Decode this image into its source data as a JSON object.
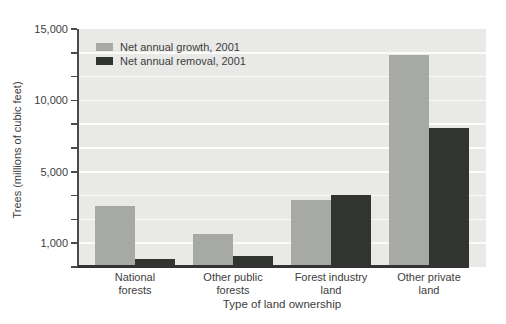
{
  "chart_data": {
    "type": "bar",
    "title": "",
    "xlabel": "Type of land ownership",
    "ylabel": "Trees (millions of cubic feet)",
    "categories": [
      "National forests",
      "Other public forests",
      "Forest industry land",
      "Other private land"
    ],
    "series": [
      {
        "name": "Net annual growth, 2001",
        "color": "#a6a9a4",
        "values": [
          3100,
          1500,
          3400,
          13200
        ]
      },
      {
        "name": "Net annual removal, 2001",
        "color": "#313431",
        "values": [
          350,
          450,
          3700,
          8100
        ]
      }
    ],
    "y_axis": {
      "ticks": [
        {
          "label": "15,000",
          "value": 15000,
          "frac": 0.0
        },
        {
          "label": "10,000",
          "value": 10000,
          "frac": 0.3
        },
        {
          "label": "5,000",
          "value": 5000,
          "frac": 0.6
        },
        {
          "label": "1,000",
          "value": 1000,
          "frac": 0.9
        },
        {
          "label": "",
          "value": 0,
          "frac": 1.0
        }
      ],
      "minor_tick_step_frac": 0.1,
      "spacing_note": "non-linear tick spacing as printed in source figure"
    },
    "ylim": [
      0,
      15000
    ],
    "grid": "horizontal white gridlines on gray panel",
    "legend_position": "top-left inside plot",
    "colors": {
      "plot_background": "#e9e9e7",
      "gridline": "#fcfcfb",
      "axis": "#4a4a4a",
      "x_axis_line": "#333333",
      "text": "#3d3d3d",
      "page_background": "#ffffff"
    }
  }
}
